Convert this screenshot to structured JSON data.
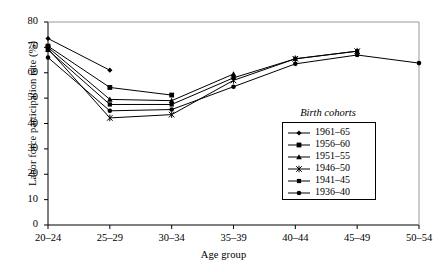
{
  "chart_data": {
    "type": "line",
    "title": "",
    "xlabel": "Age group",
    "ylabel": "Labor force participation rate (%)",
    "categories": [
      "20–24",
      "25–29",
      "30–34",
      "35–39",
      "40–44",
      "45–49",
      "50–54"
    ],
    "ylim": [
      0,
      80
    ],
    "yticks": [
      "0",
      "10",
      "20",
      "30",
      "40",
      "50",
      "60",
      "70",
      "80"
    ],
    "ytick_values": [
      0,
      10,
      20,
      30,
      40,
      50,
      60,
      70,
      80
    ],
    "grid": false,
    "legend_position": "inside-right",
    "legend_title": "Birth cohorts",
    "series": [
      {
        "name": "1961–65",
        "marker": "diamond",
        "values": [
          73.5,
          61.0,
          null,
          null,
          null,
          null,
          null
        ]
      },
      {
        "name": "1956–60",
        "marker": "square",
        "values": [
          70.5,
          54.2,
          51.2,
          null,
          null,
          null,
          null
        ]
      },
      {
        "name": "1951–55",
        "marker": "triangle",
        "values": [
          70.0,
          49.5,
          49.0,
          59.5,
          null,
          null,
          null
        ]
      },
      {
        "name": "1946–50",
        "marker": "asterisk",
        "values": [
          69.5,
          42.2,
          43.5,
          57.0,
          65.5,
          68.5,
          null
        ]
      },
      {
        "name": "1941–45",
        "marker": "square-small",
        "values": [
          69.0,
          47.5,
          47.5,
          58.0,
          65.5,
          68.5,
          null
        ]
      },
      {
        "name": "1936–40",
        "marker": "circle",
        "values": [
          66.0,
          45.0,
          45.5,
          54.5,
          63.5,
          67.0,
          63.8
        ]
      }
    ]
  }
}
